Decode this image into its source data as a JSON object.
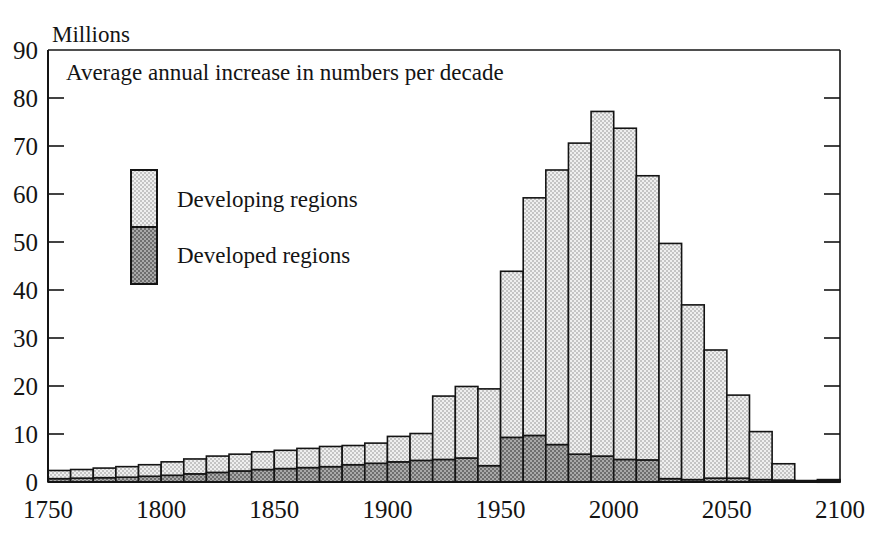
{
  "chart_data": {
    "type": "bar",
    "title": "Average annual increase in numbers per decade",
    "unit_label": "Millions",
    "xlabel": "",
    "ylabel": "Millions",
    "ylim": [
      0,
      90
    ],
    "xlim": [
      1750,
      2100
    ],
    "grid": false,
    "stacked": true,
    "bar_span_years": 10,
    "legend_position": "upper-left-inside",
    "ytick_labels": [
      "0",
      "10",
      "20",
      "30",
      "40",
      "50",
      "60",
      "70",
      "80",
      "90"
    ],
    "ytick_values": [
      0,
      10,
      20,
      30,
      40,
      50,
      60,
      70,
      80,
      90
    ],
    "xtick_labels": [
      "1750",
      "1800",
      "1850",
      "1900",
      "1950",
      "2000",
      "2050",
      "2100"
    ],
    "xtick_values": [
      1750,
      1800,
      1850,
      1900,
      1950,
      2000,
      2050,
      2100
    ],
    "categories": [
      "1750",
      "1760",
      "1770",
      "1780",
      "1790",
      "1800",
      "1810",
      "1820",
      "1830",
      "1840",
      "1850",
      "1860",
      "1870",
      "1880",
      "1890",
      "1900",
      "1910",
      "1920",
      "1930",
      "1940",
      "1950",
      "1960",
      "1970",
      "1980",
      "1990",
      "2000",
      "2010",
      "2020",
      "2030",
      "2040",
      "2050",
      "2060",
      "2070",
      "2080",
      "2090"
    ],
    "series": [
      {
        "name": "Developed regions",
        "color": "#8c8c8c",
        "pattern": "dark-checker",
        "values": [
          0.7,
          0.8,
          0.9,
          1.0,
          1.2,
          1.4,
          1.7,
          2.0,
          2.3,
          2.6,
          2.8,
          3.0,
          3.2,
          3.6,
          3.9,
          4.2,
          4.5,
          4.7,
          5.0,
          3.4,
          9.3,
          9.7,
          7.8,
          5.8,
          5.4,
          4.7,
          4.6,
          0.7,
          0.5,
          0.8,
          0.8,
          0.5,
          0.4,
          0.3,
          0.2
        ]
      },
      {
        "name": "Developing regions",
        "color": "#dcdcdc",
        "pattern": "light-dots",
        "values": [
          1.7,
          1.8,
          2.0,
          2.2,
          2.4,
          2.8,
          3.1,
          3.4,
          3.5,
          3.7,
          3.8,
          4.0,
          4.2,
          4.0,
          4.2,
          5.3,
          5.6,
          13.2,
          14.9,
          16.0,
          34.6,
          49.5,
          57.2,
          64.8,
          71.8,
          69.0,
          59.2,
          49.0,
          36.4,
          26.7,
          17.3,
          10.0,
          3.4,
          0.0,
          0.3
        ]
      }
    ],
    "totals": [
      2.4,
      2.6,
      2.9,
      3.2,
      3.6,
      4.2,
      4.8,
      5.4,
      5.8,
      6.3,
      6.6,
      7.0,
      7.4,
      7.6,
      8.1,
      9.5,
      10.1,
      17.9,
      19.9,
      19.4,
      43.9,
      59.2,
      65.0,
      70.6,
      77.2,
      73.7,
      63.8,
      49.7,
      36.9,
      27.5,
      18.1,
      10.5,
      3.8,
      0.3,
      0.5
    ],
    "annotations": []
  },
  "legend": {
    "items": [
      {
        "label": "Developing regions",
        "swatch": "light-dots"
      },
      {
        "label": "Developed regions",
        "swatch": "dark-checker"
      }
    ]
  }
}
